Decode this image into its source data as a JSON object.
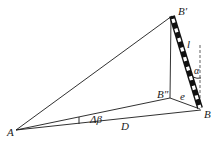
{
  "diagram": {
    "type": "geometry",
    "points": {
      "A": {
        "label": "A",
        "x": 16,
        "y": 130
      },
      "B_prime": {
        "label": "B′",
        "x": 172,
        "y": 16
      },
      "B_double_prime": {
        "label": "B″",
        "x": 170,
        "y": 98
      },
      "B": {
        "label": "B",
        "x": 201,
        "y": 110
      }
    },
    "labels": {
      "A": "A",
      "B": "B",
      "B_prime": "B′",
      "B_double_prime": "B″",
      "staff_length": "l",
      "tilt_angle": "α",
      "offset": "e",
      "angle_delta": "Δβ",
      "distance": "D"
    },
    "colors": {
      "line": "#1a1a1a",
      "staff_dark": "#111111",
      "staff_light": "#ffffff"
    }
  }
}
